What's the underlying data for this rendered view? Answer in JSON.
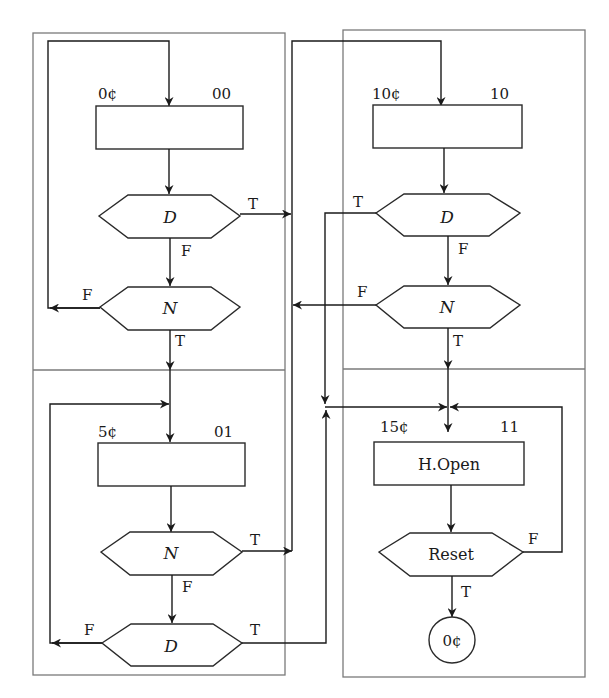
{
  "diagram": {
    "type": "ASM chart (vending machine, coin states)",
    "states": [
      {
        "id": "s0",
        "value_label": "0¢",
        "code": "00",
        "action": ""
      },
      {
        "id": "s1",
        "value_label": "5¢",
        "code": "01",
        "action": ""
      },
      {
        "id": "s2",
        "value_label": "10¢",
        "code": "10",
        "action": ""
      },
      {
        "id": "s3",
        "value_label": "15¢",
        "code": "11",
        "action": "H.Open"
      }
    ],
    "decisions": {
      "s0_d": {
        "label": "D",
        "true": "T",
        "false": "F"
      },
      "s0_n": {
        "label": "N",
        "true": "T",
        "false": "F"
      },
      "s1_n": {
        "label": "N",
        "true": "T",
        "false": "F"
      },
      "s1_d": {
        "label": "D",
        "true": "T",
        "false": "F"
      },
      "s2_d": {
        "label": "D",
        "true": "T",
        "false": "F"
      },
      "s2_n": {
        "label": "N",
        "true": "T",
        "false": "F"
      },
      "s3_reset": {
        "label": "Reset",
        "true": "T",
        "false": "F"
      }
    },
    "terminal": {
      "label": "0¢"
    },
    "colors": {
      "line": "#1a1a1a",
      "frame": "#7a7a7a",
      "background": "#ffffff"
    }
  }
}
